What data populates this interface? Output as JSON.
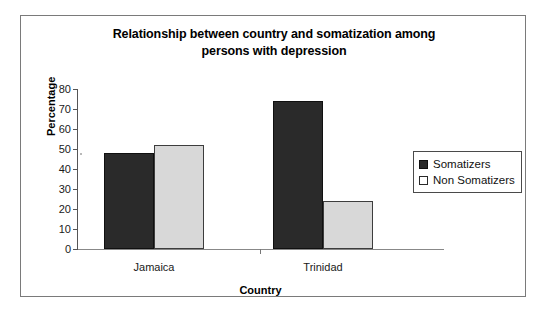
{
  "chart_data": {
    "type": "bar",
    "title": "Relationship between country and somatization among persons with depression",
    "title_lines": [
      "Relationship between country and somatization among",
      "persons with depression"
    ],
    "xlabel": "Country",
    "ylabel": "Percentage",
    "categories": [
      "Jamaica",
      "Trinidad"
    ],
    "series": [
      {
        "name": "Somatizers",
        "values": [
          48,
          74
        ],
        "color": "#2a2a2a"
      },
      {
        "name": "Non Somatizers",
        "values": [
          52,
          24
        ],
        "color": "#d8d8d8"
      }
    ],
    "ylim": [
      0,
      80
    ],
    "ytick_step": 10,
    "yticks": [
      0,
      10,
      20,
      30,
      40,
      50,
      60,
      70,
      80
    ],
    "ytick_labels": [
      "0",
      "10",
      "20",
      "30",
      "40",
      "50",
      "60",
      "70",
      "80"
    ],
    "grid": false,
    "legend_position": "right"
  },
  "legend": {
    "items": [
      {
        "label": "Somatizers",
        "swatch": "filled-dark-square-icon"
      },
      {
        "label": "Non Somatizers",
        "swatch": "outlined-light-square-icon"
      }
    ]
  }
}
